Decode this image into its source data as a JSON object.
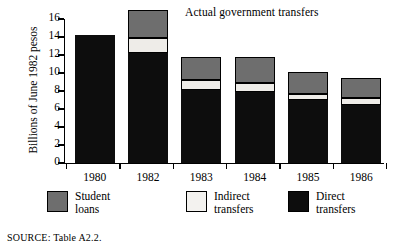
{
  "chart_data": {
    "type": "bar",
    "subtype": "stacked-bar",
    "title": "Actual government transfers",
    "xlabel": "",
    "ylabel": "Billions of June 1982 pesos",
    "categories": [
      "1980",
      "1982",
      "1983",
      "1984",
      "1985",
      "1986"
    ],
    "series": [
      {
        "name": "Direct transfers",
        "color": "#0d0d0d",
        "values": [
          14.2,
          12.2,
          8.1,
          7.9,
          7.0,
          6.4
        ]
      },
      {
        "name": "Indirect transfers",
        "color": "#eeece8",
        "values": [
          0.0,
          1.7,
          1.1,
          1.0,
          0.7,
          0.8
        ]
      },
      {
        "name": "Student loans",
        "color": "#6e6e6e",
        "values": [
          0.0,
          3.1,
          2.6,
          2.9,
          2.4,
          2.3
        ]
      }
    ],
    "totals": [
      14.2,
      16.0,
      11.8,
      11.8,
      10.1,
      9.5
    ],
    "ylim": [
      0,
      16
    ],
    "yticks": [
      0,
      2,
      4,
      6,
      8,
      10,
      12,
      14,
      16
    ],
    "ytick_labels": [
      "0",
      "2",
      "4",
      "6",
      "8",
      "10",
      "12",
      "14",
      "16"
    ],
    "grid": false,
    "legend_position": "bottom",
    "legend": [
      {
        "label_line1": "Student",
        "label_line2": "loans",
        "color": "#6e6e6e"
      },
      {
        "label_line1": "Indirect",
        "label_line2": "transfers",
        "color": "#eeece8"
      },
      {
        "label_line1": "Direct",
        "label_line2": "transfers",
        "color": "#0d0d0d"
      }
    ]
  },
  "source": {
    "label": "SOURCE:",
    "text": "Table A2.2."
  }
}
